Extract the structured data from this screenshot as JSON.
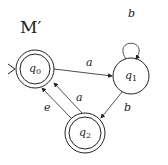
{
  "diagram": {
    "title": "M′",
    "states": [
      {
        "id": "q0",
        "name": "q",
        "sub": "0",
        "accepting": true,
        "start": true
      },
      {
        "id": "q1",
        "name": "q",
        "sub": "1",
        "accepting": false,
        "start": false
      },
      {
        "id": "q2",
        "name": "q",
        "sub": "2",
        "accepting": true,
        "start": false
      }
    ],
    "transitions": [
      {
        "from": "q0",
        "to": "q1",
        "label": "a"
      },
      {
        "from": "q1",
        "to": "q1",
        "label": "b"
      },
      {
        "from": "q1",
        "to": "q2",
        "label": "b"
      },
      {
        "from": "q2",
        "to": "q0",
        "label": "a"
      },
      {
        "from": "q2",
        "to": "q0",
        "label": "e"
      }
    ],
    "colors": {
      "stroke": "#222222",
      "background": "#ffffff"
    }
  }
}
